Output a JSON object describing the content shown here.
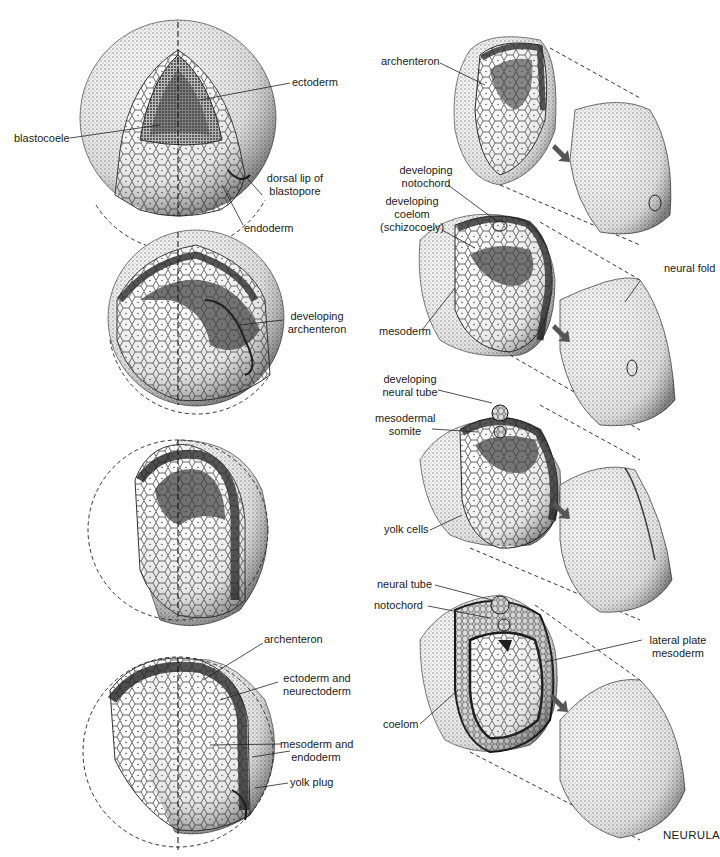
{
  "figure": {
    "title": "NEURULA",
    "left_column": {
      "stage1": {
        "labels": {
          "ectoderm": "ectoderm",
          "blastocoele": "blastocoele",
          "dorsal_lip_1": "dorsal lip of",
          "dorsal_lip_2": "blastopore",
          "endoderm": "endoderm"
        }
      },
      "stage2": {
        "labels": {
          "dev_archenteron_1": "developing",
          "dev_archenteron_2": "archenteron"
        }
      },
      "stage3": {
        "labels": {}
      },
      "stage4": {
        "labels": {
          "archenteron": "archenteron",
          "ecto_1": "ectoderm and",
          "ecto_2": "neurectoderm",
          "meso_1": "mesoderm and",
          "meso_2": "endoderm",
          "yolk_plug": "yolk plug"
        }
      }
    },
    "right_column": {
      "stage1": {
        "labels": {
          "archenteron": "archenteron"
        }
      },
      "stage2": {
        "labels": {
          "notochord_1": "developing",
          "notochord_2": "notochord",
          "coelom_1": "developing",
          "coelom_2": "coelom",
          "coelom_3": "(schizocoely)",
          "mesoderm": "mesoderm",
          "neural_fold": "neural fold"
        }
      },
      "stage3": {
        "labels": {
          "neural_tube_1": "developing",
          "neural_tube_2": "neural tube",
          "somite_1": "mesodermal",
          "somite_2": "somite",
          "yolk_cells": "yolk cells"
        }
      },
      "stage4": {
        "labels": {
          "neural_tube": "neural tube",
          "notochord": "notochord",
          "lateral_1": "lateral plate",
          "lateral_2": "mesoderm",
          "coelom": "coelom"
        }
      }
    }
  }
}
